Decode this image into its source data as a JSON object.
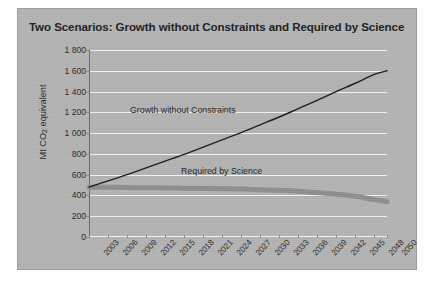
{
  "figure": {
    "title": "Two Scenarios: Growth without Constraints and Required by Science",
    "panel_color": "#b3b3b3",
    "gridline_color": "#f2f2f2",
    "axis_color": "#6e6e6e"
  },
  "chart_data": {
    "type": "line",
    "title": "Two Scenarios: Growth without Constraints and Required by Science",
    "xlabel": "",
    "ylabel": "Mt CO2 equivalent",
    "ylabel_parts": {
      "prefix": "Mt CO",
      "sub": "2",
      "suffix": " equivalent"
    },
    "xlim": [
      2003,
      2050
    ],
    "ylim": [
      0,
      1800
    ],
    "grid": true,
    "legend": "inline-annotations",
    "ytick_labels": [
      "0",
      "200",
      "400",
      "600",
      "800",
      "1 000",
      "1 200",
      "1 400",
      "1 600",
      "1 800"
    ],
    "ytick_values": [
      0,
      200,
      400,
      600,
      800,
      1000,
      1200,
      1400,
      1600,
      1800
    ],
    "categories": [
      2003,
      2006,
      2009,
      2012,
      2015,
      2018,
      2021,
      2024,
      2027,
      2030,
      2033,
      2036,
      2039,
      2042,
      2045,
      2048,
      2050
    ],
    "xtick_labels": [
      "2003",
      "2006",
      "2009",
      "2012",
      "2015",
      "2018",
      "2021",
      "2024",
      "2027",
      "2030",
      "2033",
      "2036",
      "2039",
      "2042",
      "2045",
      "2048",
      "2050"
    ],
    "series": [
      {
        "name": "Growth without Constraints",
        "color": "#1c1c1c",
        "width": 1.4,
        "values": [
          480,
          540,
          600,
          665,
          730,
          795,
          865,
          935,
          1005,
          1080,
          1155,
          1235,
          1315,
          1400,
          1480,
          1565,
          1600
        ]
      },
      {
        "name": "Required by Science",
        "color": "#8e8e8e",
        "width": 5,
        "values": [
          480,
          478,
          476,
          474,
          472,
          470,
          468,
          465,
          461,
          456,
          449,
          440,
          427,
          412,
          392,
          360,
          340
        ]
      }
    ],
    "annotations": [
      {
        "text": "Growth without Constraints",
        "x": 2018,
        "y": 1090
      },
      {
        "text": "Required by Science",
        "x": 2030,
        "y": 430
      }
    ]
  }
}
